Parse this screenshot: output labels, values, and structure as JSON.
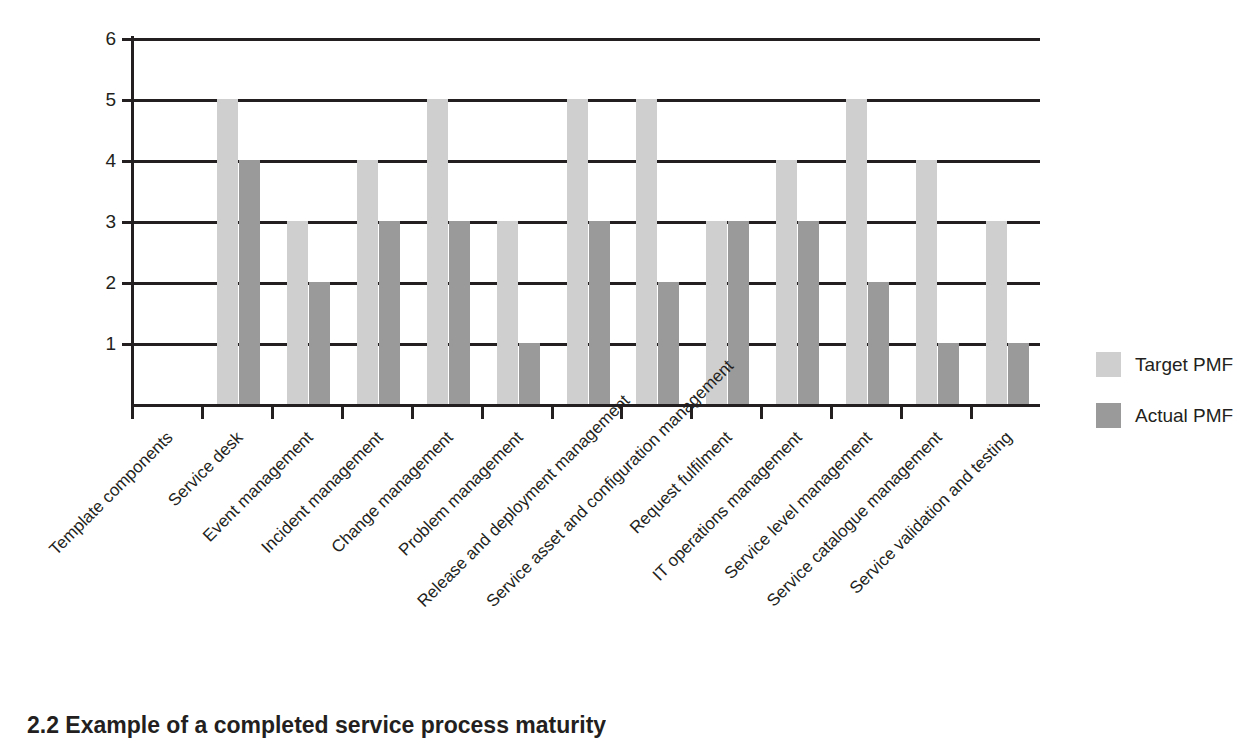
{
  "chart_data": {
    "type": "bar",
    "title": "",
    "xlabel": "",
    "ylabel": "",
    "ylim": [
      0,
      6
    ],
    "yticks": [
      "1",
      "2",
      "3",
      "4",
      "5",
      "6"
    ],
    "grid": true,
    "legend_position": "right",
    "categories": [
      "Template components",
      "Service desk",
      "Event management",
      "Incident management",
      "Change management",
      "Problem management",
      "Release and deployment management",
      "Service asset and configuration management",
      "Request fulfilment",
      "IT operations management",
      "Service level management",
      "Service catalogue management",
      "Service validation and testing"
    ],
    "series": [
      {
        "name": "Target PMF",
        "color": "#cfcfcf",
        "values": [
          0,
          5,
          3,
          4,
          5,
          3,
          5,
          5,
          3,
          4,
          5,
          4,
          3
        ]
      },
      {
        "name": "Actual PMF",
        "color": "#9a9a9a",
        "values": [
          0,
          4,
          2,
          3,
          3,
          1,
          3,
          2,
          3,
          3,
          2,
          1,
          1
        ]
      }
    ]
  },
  "legend": {
    "entries": [
      {
        "label": "Target PMF",
        "color": "#cfcfcf"
      },
      {
        "label": "Actual PMF",
        "color": "#9a9a9a"
      }
    ]
  },
  "caption": {
    "text": "2.2 Example of a completed service process maturity"
  }
}
